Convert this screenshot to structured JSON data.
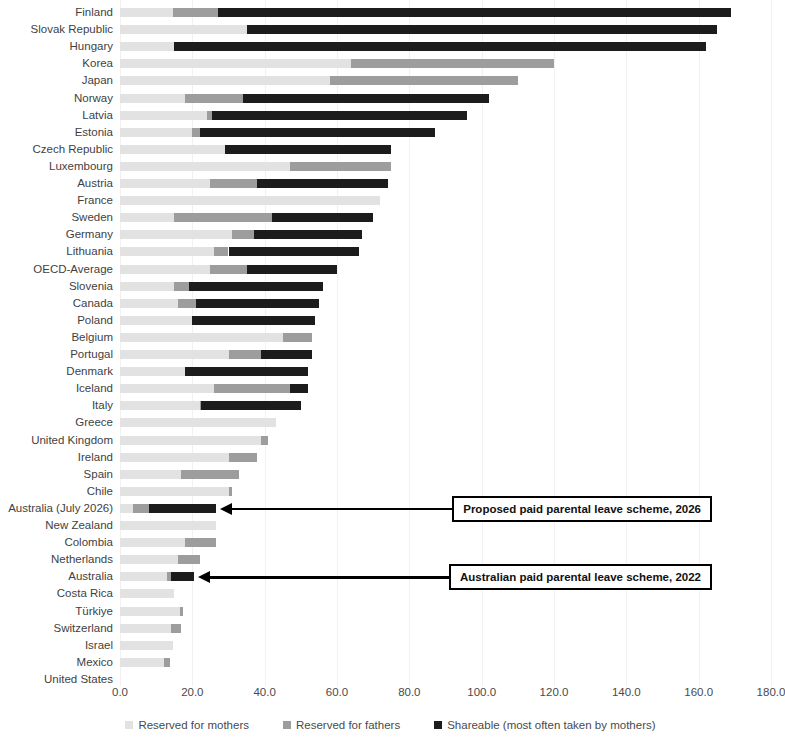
{
  "chart_data": {
    "type": "bar",
    "subtype": "stacked-horizontal",
    "title": "",
    "xlabel": "",
    "ylabel": "",
    "xlim": [
      0,
      180
    ],
    "xticks": [
      "0.0",
      "20.0",
      "40.0",
      "60.0",
      "80.0",
      "100.0",
      "120.0",
      "140.0",
      "160.0",
      "180.0"
    ],
    "xtick_values": [
      0,
      20,
      40,
      60,
      80,
      100,
      120,
      140,
      160,
      180
    ],
    "grid": false,
    "legend_position": "bottom",
    "colors": {
      "mothers": "#e2e2e2",
      "fathers": "#9d9d9d",
      "shareable": "#1c1c1c",
      "annotation": "#000000"
    },
    "series": [
      {
        "name": "Reserved for mothers",
        "key": "mothers"
      },
      {
        "name": "Reserved for fathers",
        "key": "fathers"
      },
      {
        "name": "Shareable (most often taken by mothers)",
        "key": "shareable"
      }
    ],
    "categories": [
      "Finland",
      "Slovak Republic",
      "Hungary",
      "Korea",
      "Japan",
      "Norway",
      "Latvia",
      "Estonia",
      "Czech Republic",
      "Luxembourg",
      "Austria",
      "France",
      "Sweden",
      "Germany",
      "Lithuania",
      "OECD-Average",
      "Slovenia",
      "Canada",
      "Poland",
      "Belgium",
      "Portugal",
      "Denmark",
      "Iceland",
      "Italy",
      "Greece",
      "United Kingdom",
      "Ireland",
      "Spain",
      "Chile",
      "Australia (July 2026)",
      "New Zealand",
      "Colombia",
      "Netherlands",
      "Australia",
      "Costa Rica",
      "Türkiye",
      "Switzerland",
      "Israel",
      "Mexico",
      "United States"
    ],
    "rows": [
      {
        "category": "Finland",
        "mothers": 14.6,
        "fathers": 12.4,
        "shareable": 142.0,
        "total": 169.0
      },
      {
        "category": "Slovak Republic",
        "mothers": 35.0,
        "fathers": 0.0,
        "shareable": 130.0,
        "total": 165.0
      },
      {
        "category": "Hungary",
        "mothers": 15.0,
        "fathers": 0.0,
        "shareable": 147.0,
        "total": 162.0
      },
      {
        "category": "Korea",
        "mothers": 64.0,
        "fathers": 56.0,
        "shareable": 0.0,
        "total": 120.0
      },
      {
        "category": "Japan",
        "mothers": 58.0,
        "fathers": 52.0,
        "shareable": 0.0,
        "total": 110.0
      },
      {
        "category": "Norway",
        "mothers": 18.0,
        "fathers": 16.0,
        "shareable": 68.0,
        "total": 102.0
      },
      {
        "category": "Latvia",
        "mothers": 24.0,
        "fathers": 1.4,
        "shareable": 70.6,
        "total": 96.0
      },
      {
        "category": "Estonia",
        "mothers": 20.0,
        "fathers": 2.0,
        "shareable": 65.0,
        "total": 87.0
      },
      {
        "category": "Czech Republic",
        "mothers": 29.0,
        "fathers": 0.0,
        "shareable": 46.0,
        "total": 75.0
      },
      {
        "category": "Luxembourg",
        "mothers": 47.0,
        "fathers": 28.0,
        "shareable": 0.0,
        "total": 75.0
      },
      {
        "category": "Austria",
        "mothers": 25.0,
        "fathers": 13.0,
        "shareable": 36.0,
        "total": 74.0
      },
      {
        "category": "France",
        "mothers": 72.0,
        "fathers": 0.0,
        "shareable": 0.0,
        "total": 72.0
      },
      {
        "category": "Sweden",
        "mothers": 15.0,
        "fathers": 27.0,
        "shareable": 28.0,
        "total": 70.0
      },
      {
        "category": "Germany",
        "mothers": 31.0,
        "fathers": 6.0,
        "shareable": 30.0,
        "total": 67.0
      },
      {
        "category": "Lithuania",
        "mothers": 26.0,
        "fathers": 4.0,
        "shareable": 36.0,
        "total": 66.0
      },
      {
        "category": "OECD-Average",
        "mothers": 25.0,
        "fathers": 10.0,
        "shareable": 25.0,
        "total": 60.0
      },
      {
        "category": "Slovenia",
        "mothers": 15.0,
        "fathers": 4.0,
        "shareable": 37.0,
        "total": 56.0
      },
      {
        "category": "Canada",
        "mothers": 16.0,
        "fathers": 5.0,
        "shareable": 34.0,
        "total": 55.0
      },
      {
        "category": "Poland",
        "mothers": 20.0,
        "fathers": 0.0,
        "shareable": 34.0,
        "total": 54.0
      },
      {
        "category": "Belgium",
        "mothers": 45.0,
        "fathers": 8.0,
        "shareable": 0.0,
        "total": 53.0
      },
      {
        "category": "Portugal",
        "mothers": 30.0,
        "fathers": 9.0,
        "shareable": 14.0,
        "total": 53.0
      },
      {
        "category": "Denmark",
        "mothers": 18.0,
        "fathers": 0.0,
        "shareable": 34.0,
        "total": 52.0
      },
      {
        "category": "Iceland",
        "mothers": 26.0,
        "fathers": 21.0,
        "shareable": 5.0,
        "total": 52.0
      },
      {
        "category": "Italy",
        "mothers": 22.0,
        "fathers": 0.5,
        "shareable": 27.5,
        "total": 50.0
      },
      {
        "category": "Greece",
        "mothers": 43.0,
        "fathers": 0.0,
        "shareable": 0.0,
        "total": 43.0
      },
      {
        "category": "United Kingdom",
        "mothers": 39.0,
        "fathers": 2.0,
        "shareable": 0.0,
        "total": 41.0
      },
      {
        "category": "Ireland",
        "mothers": 30.0,
        "fathers": 8.0,
        "shareable": 0.0,
        "total": 38.0
      },
      {
        "category": "Spain",
        "mothers": 17.0,
        "fathers": 16.0,
        "shareable": 0.0,
        "total": 33.0
      },
      {
        "category": "Chile",
        "mothers": 30.0,
        "fathers": 1.0,
        "shareable": 0.0,
        "total": 31.0
      },
      {
        "category": "Australia (July 2026)",
        "mothers": 3.6,
        "fathers": 4.4,
        "shareable": 18.5,
        "total": 26.5
      },
      {
        "category": "New Zealand",
        "mothers": 26.5,
        "fathers": 0.0,
        "shareable": 0.0,
        "total": 26.5
      },
      {
        "category": "Colombia",
        "mothers": 18.0,
        "fathers": 8.5,
        "shareable": 0.0,
        "total": 26.5
      },
      {
        "category": "Netherlands",
        "mothers": 16.0,
        "fathers": 6.0,
        "shareable": 0.0,
        "total": 22.0
      },
      {
        "category": "Australia",
        "mothers": 13.0,
        "fathers": 1.0,
        "shareable": 6.5,
        "total": 20.5
      },
      {
        "category": "Costa Rica",
        "mothers": 15.0,
        "fathers": 0.0,
        "shareable": 0.0,
        "total": 15.0
      },
      {
        "category": "Türkiye",
        "mothers": 16.5,
        "fathers": 1.0,
        "shareable": 0.0,
        "total": 17.5
      },
      {
        "category": "Switzerland",
        "mothers": 14.0,
        "fathers": 3.0,
        "shareable": 0.0,
        "total": 17.0
      },
      {
        "category": "Israel",
        "mothers": 14.7,
        "fathers": 0.0,
        "shareable": 0.0,
        "total": 14.7
      },
      {
        "category": "Mexico",
        "mothers": 12.3,
        "fathers": 1.4,
        "shareable": 0.0,
        "total": 13.7
      },
      {
        "category": "United States",
        "mothers": 0.0,
        "fathers": 0.0,
        "shareable": 0.0,
        "total": 0.0
      }
    ],
    "annotations": [
      {
        "text": "Proposed paid parental leave scheme, 2026",
        "target_category": "Australia (July 2026)"
      },
      {
        "text": "Australian paid parental leave scheme, 2022",
        "target_category": "Australia"
      }
    ]
  }
}
